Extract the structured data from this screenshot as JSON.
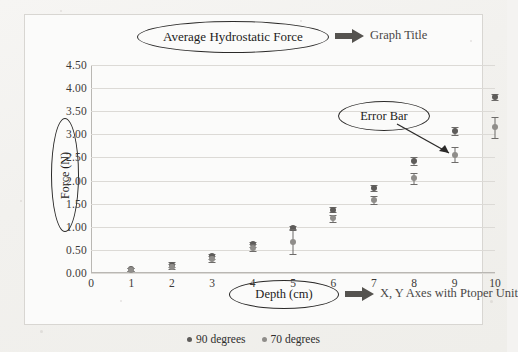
{
  "chart_data": {
    "type": "scatter",
    "title": "Average Hydrostatic Force",
    "xlabel": "Depth (cm)",
    "ylabel": "Force (N)",
    "xlim": [
      0,
      10
    ],
    "ylim": [
      0.0,
      4.5
    ],
    "ytick_step": 0.5,
    "grid": true,
    "legend_position": "bottom-center",
    "x_ticks": [
      "0",
      "1",
      "2",
      "3",
      "4",
      "5",
      "6",
      "7",
      "8",
      "9",
      "10"
    ],
    "y_ticks": [
      "0.00",
      "0.50",
      "1.00",
      "1.50",
      "2.00",
      "2.50",
      "3.00",
      "3.50",
      "4.00",
      "4.50"
    ],
    "series": [
      {
        "name": "90 degrees",
        "color": "#5e5c5a",
        "x": [
          1,
          2,
          3,
          4,
          5,
          6,
          7,
          8,
          9,
          10
        ],
        "values": [
          0.08,
          0.18,
          0.36,
          0.62,
          0.98,
          1.37,
          1.84,
          2.43,
          3.07,
          3.81
        ],
        "errors": [
          0.03,
          0.05,
          0.06,
          0.06,
          0.04,
          0.05,
          0.07,
          0.09,
          0.08,
          0.07
        ]
      },
      {
        "name": "70 degrees",
        "color": "#8f8d8a",
        "x": [
          1,
          2,
          3,
          4,
          5,
          6,
          7,
          8,
          9,
          10
        ],
        "values": [
          0.07,
          0.14,
          0.3,
          0.55,
          0.68,
          1.18,
          1.58,
          2.05,
          2.56,
          3.15
        ],
        "errors": [
          0.03,
          0.05,
          0.07,
          0.07,
          0.27,
          0.07,
          0.08,
          0.12,
          0.16,
          0.22
        ]
      }
    ]
  },
  "annotations": {
    "title_callout": "Average Hydrostatic Force",
    "title_note": "Graph Title",
    "error_bar_callout": "Error Bar",
    "xaxis_callout": "Depth (cm)",
    "axes_note": "X, Y Axes with Ptoper Unit",
    "yaxis_callout": "Force (N)"
  },
  "legend": {
    "items": [
      {
        "label": "90 degrees",
        "color": "#5e5c5a"
      },
      {
        "label": "70 degrees",
        "color": "#8f8d8a"
      }
    ]
  }
}
